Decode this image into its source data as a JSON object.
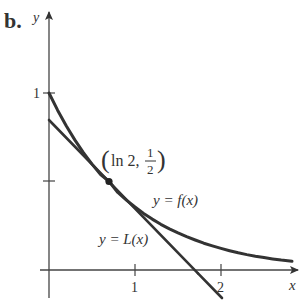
{
  "panel_label": "b.",
  "axes": {
    "x_label": "x",
    "y_label": "y",
    "x_ticks": [
      "1",
      "2"
    ],
    "y_ticks": [
      "1"
    ]
  },
  "point": {
    "label_open": "(",
    "label_x": "ln 2,",
    "label_num": "1",
    "label_den": "2",
    "label_close": ")"
  },
  "curves": {
    "f_label": "y = f(x)",
    "L_label": "y = L(x)"
  },
  "colors": {
    "curve": "#333333",
    "axis": "#444444"
  }
}
